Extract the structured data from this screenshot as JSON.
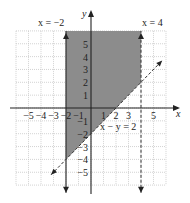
{
  "chart_data": {
    "type": "area",
    "title": "",
    "xlabel": "x",
    "ylabel": "y",
    "xlim": [
      -6,
      6
    ],
    "ylim": [
      -6,
      6
    ],
    "grid": true,
    "x_ticks": [
      "−5",
      "−4",
      "−3",
      "−2",
      "−1",
      "1",
      "2",
      "3",
      "5"
    ],
    "x_tick_values": [
      -5,
      -4,
      -3,
      -2,
      -1,
      1,
      2,
      3,
      5
    ],
    "y_ticks": [
      "5",
      "4",
      "3",
      "2",
      "1",
      "−1",
      "−2",
      "−3",
      "−4",
      "−5"
    ],
    "y_tick_values": [
      5,
      4,
      3,
      2,
      1,
      -1,
      -2,
      -3,
      -4,
      -5
    ],
    "boundaries": [
      {
        "label": "x = −2",
        "equation": "x = -2",
        "style": "solid",
        "included": true
      },
      {
        "label": "x = 4",
        "equation": "x = 4",
        "style": "dashed",
        "included": false
      },
      {
        "label": "x − y = 2",
        "equation": "y = x - 2",
        "style": "dashed",
        "included": false
      }
    ],
    "shaded_region": {
      "description": "-2 <= x < 4 and x - y < 2",
      "vertices": [
        [
          -2,
          6
        ],
        [
          4,
          6
        ],
        [
          4,
          2
        ],
        [
          -2,
          -4
        ]
      ],
      "color": "#8c8c8c"
    }
  },
  "labels": {
    "x_axis": "x",
    "y_axis": "y",
    "left_line": "x = −2",
    "right_line": "x = 4",
    "diag_line": "x − y = 2"
  },
  "colors": {
    "shade": "#8c8c8c",
    "grid": "#c8c8c8",
    "axis": "#222222",
    "line": "#333333"
  }
}
